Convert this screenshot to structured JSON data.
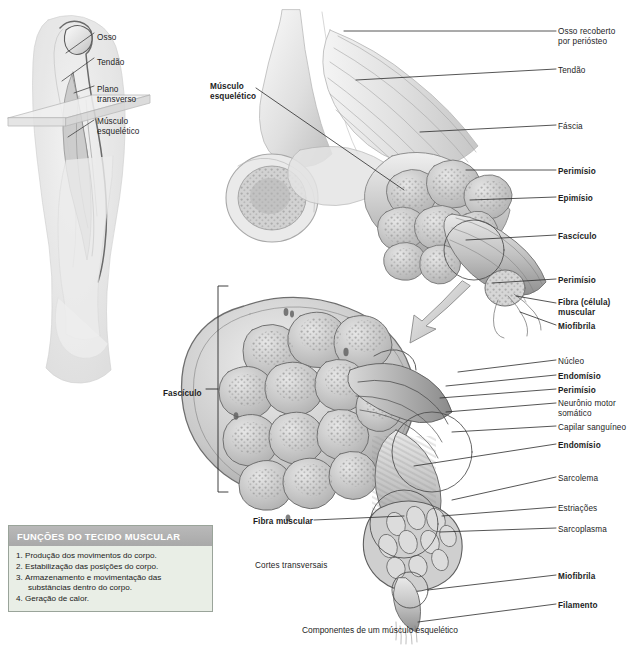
{
  "inset": {
    "labels": [
      {
        "text": "Osso",
        "x": 97,
        "y": 33,
        "bold": false
      },
      {
        "text": "Tendão",
        "x": 97,
        "y": 58,
        "bold": false
      },
      {
        "text": "Plano\ntransverso",
        "x": 97,
        "y": 85,
        "bold": false
      },
      {
        "text": "Músculo\nesquelético",
        "x": 97,
        "y": 117,
        "bold": false
      }
    ]
  },
  "main": {
    "left_labels": [
      {
        "text": "Músculo\nesquelético",
        "x": 210,
        "y": 82,
        "bold": true,
        "align": "left"
      },
      {
        "text": "Fascículo",
        "x": 163,
        "y": 389,
        "bold": true,
        "align": "left"
      },
      {
        "text": "Fibra muscular",
        "x": 253,
        "y": 517,
        "bold": true,
        "align": "left"
      },
      {
        "text": "Cortes transversais",
        "x": 255,
        "y": 561,
        "bold": false,
        "align": "left"
      }
    ],
    "right_labels": [
      {
        "text": "Osso recoberto\npor perióstseo_FIX",
        "x": 558,
        "y": 27,
        "bold": false
      },
      {
        "text": "Tendão",
        "x": 558,
        "y": 66,
        "bold": false
      },
      {
        "text": "Fáscia",
        "x": 558,
        "y": 122,
        "bold": false
      },
      {
        "text": "Perimísio",
        "x": 558,
        "y": 167,
        "bold": true
      },
      {
        "text": "Epimísio",
        "x": 558,
        "y": 194,
        "bold": true
      },
      {
        "text": "Fascículo",
        "x": 558,
        "y": 232,
        "bold": true
      },
      {
        "text": "Perimísio",
        "x": 558,
        "y": 276,
        "bold": true
      },
      {
        "text": "Fibra (célula)\nmuscular",
        "x": 558,
        "y": 298,
        "bold": true
      },
      {
        "text": "Miofibrila",
        "x": 558,
        "y": 322,
        "bold": true
      },
      {
        "text": "Núcleo",
        "x": 558,
        "y": 357,
        "bold": false
      },
      {
        "text": "Endomísio",
        "x": 558,
        "y": 372,
        "bold": true
      },
      {
        "text": "Perimísio",
        "x": 558,
        "y": 386,
        "bold": true
      },
      {
        "text": "Neurônio motor\nsomático",
        "x": 558,
        "y": 399,
        "bold": false
      },
      {
        "text": "Capilar sanguíneo",
        "x": 558,
        "y": 423,
        "bold": false
      },
      {
        "text": "Endomísio",
        "x": 558,
        "y": 441,
        "bold": true
      },
      {
        "text": "Sarcolema",
        "x": 558,
        "y": 474,
        "bold": false
      },
      {
        "text": "Estriações",
        "x": 558,
        "y": 504,
        "bold": false
      },
      {
        "text": "Sarcoplasma",
        "x": 558,
        "y": 525,
        "bold": false
      },
      {
        "text": "Miofibrila",
        "x": 558,
        "y": 572,
        "bold": true
      },
      {
        "text": "Filamento",
        "x": 558,
        "y": 601,
        "bold": true
      }
    ],
    "caption": "Componentes de um músculo esquelético"
  },
  "functions_box": {
    "title": "FUNÇÕES DO TECIDO MUSCULAR",
    "items": [
      {
        "n": "1.",
        "text": "Produção dos movimentos do corpo."
      },
      {
        "n": "2.",
        "text": "Estabilização das posições do corpo."
      },
      {
        "n": "3.",
        "text": "Armazenamento e movimentação das substâncias dentro do corpo."
      },
      {
        "n": "4.",
        "text": "Geração de calor."
      }
    ]
  },
  "colors": {
    "header_band": "#b0b0b0",
    "panel_bg": "#e9eee6",
    "panel_border": "#9aa49a",
    "ink": "#1d1d1d",
    "tissue_light": "#dcdcdc",
    "tissue_mid": "#9f9f9f",
    "tissue_dark": "#6e6e6e"
  }
}
